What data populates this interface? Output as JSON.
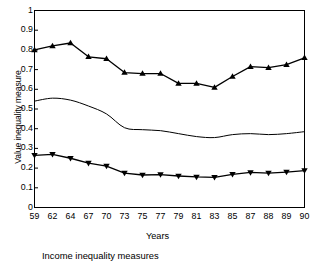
{
  "chart_data": {
    "type": "line",
    "title": "",
    "caption": "Income inequality measures",
    "xlabel": "Years",
    "ylabel": "Value inequality measure",
    "grid": false,
    "legend": "none",
    "xlim": [
      0,
      15
    ],
    "ylim": [
      0,
      1
    ],
    "yticks": [
      "1",
      "0.9",
      "0.8",
      "0.7",
      "0.6",
      "0.5",
      "0.4",
      "0.3",
      "0.2",
      "0.1",
      "0"
    ],
    "ytick_values": [
      1,
      0.9,
      0.8,
      0.7,
      0.6,
      0.5,
      0.4,
      0.3,
      0.2,
      0.1,
      0
    ],
    "categories": [
      "59",
      "62",
      "64",
      "67",
      "70",
      "73",
      "75",
      "77",
      "79",
      "81",
      "83",
      "85",
      "87",
      "88",
      "89",
      "90"
    ],
    "series": [
      {
        "name": "upper-measure",
        "marker": "triangle-up",
        "values": [
          0.8,
          0.82,
          0.835,
          0.765,
          0.755,
          0.685,
          0.68,
          0.68,
          0.63,
          0.63,
          0.61,
          0.665,
          0.715,
          0.71,
          0.725,
          0.76
        ]
      },
      {
        "name": "middle-measure",
        "marker": "none",
        "values": [
          0.54,
          0.555,
          0.545,
          0.515,
          0.475,
          0.405,
          0.395,
          0.39,
          0.375,
          0.36,
          0.355,
          0.37,
          0.375,
          0.37,
          0.375,
          0.385
        ]
      },
      {
        "name": "lower-measure",
        "marker": "triangle-down",
        "values": [
          0.265,
          0.27,
          0.25,
          0.225,
          0.21,
          0.175,
          0.165,
          0.167,
          0.16,
          0.155,
          0.153,
          0.168,
          0.178,
          0.175,
          0.18,
          0.187
        ]
      }
    ]
  },
  "colors": {
    "line": "#000000",
    "axis": "#000000",
    "background": "#ffffff"
  }
}
